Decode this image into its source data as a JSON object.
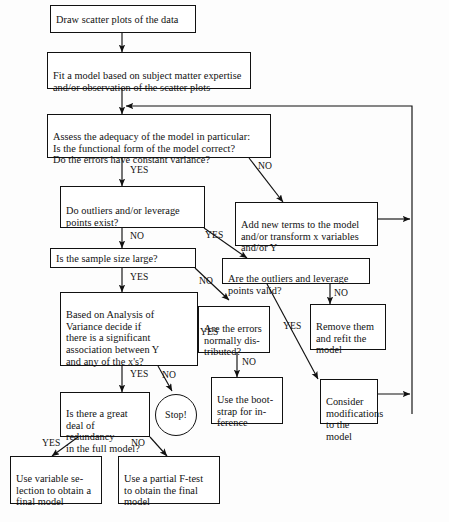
{
  "diagram": {
    "line_color": "#111111",
    "background": "#fdfdfd"
  },
  "nodes": {
    "draw_scatter": {
      "label": "Draw scatter plots of the data",
      "shape": "rect"
    },
    "fit_model": {
      "label": "Fit a model based on subject matter expertise\nand/or observation of the scatter plots",
      "shape": "rect"
    },
    "assess": {
      "label": "Assess the adequacy of the model in particular:\n     Is the functional form of the model correct?\n     Do the errors have constant variance?",
      "shape": "rect"
    },
    "outliers_exist": {
      "label": "Do outliers and/or leverage\npoints exist?",
      "shape": "rect"
    },
    "sample_size": {
      "label": "Is the sample size large?",
      "shape": "rect"
    },
    "anova": {
      "label": "Based on Analysis of\nVariance decide if\nthere is a significant\nassociation between Y\nand any of the x's?",
      "shape": "rect"
    },
    "redundancy": {
      "label": "Is there a great\ndeal of redundancy\nin the full model?",
      "shape": "rect"
    },
    "stop": {
      "label": "Stop!",
      "shape": "circle"
    },
    "variable_selection": {
      "label": "Use variable se-\nlection to obtain a\nfinal model",
      "shape": "rect"
    },
    "partial_f": {
      "label": "Use a partial F-test\nto obtain the final\nmodel",
      "shape": "rect"
    },
    "add_terms": {
      "label": "Add new terms to the model\nand/or transform x variables\nand/or Y",
      "shape": "rect"
    },
    "outliers_valid": {
      "label": "Are the outliers and leverage\npoints valid?",
      "shape": "rect"
    },
    "remove_refit": {
      "label": "Remove them\nand refit the\nmodel",
      "shape": "rect"
    },
    "errors_normal": {
      "label": "Are the errors\nnormally dis-\ntributed?",
      "shape": "rect"
    },
    "bootstrap": {
      "label": "Use the boot-\nstrap for in-\nference",
      "shape": "rect"
    },
    "consider_mods": {
      "label": "Consider\nmodifications\nto the model",
      "shape": "rect"
    }
  },
  "edge_labels": {
    "assess_no": "NO",
    "assess_yes": "YES",
    "outliers_no": "NO",
    "outliers_yes": "YES",
    "sample_yes": "YES",
    "sample_no": "NO",
    "valid_no": "NO",
    "valid_yes": "YES",
    "normal_yes": "YES",
    "normal_no": "NO",
    "anova_yes": "YES",
    "anova_no": "NO",
    "redundancy_yes": "YES",
    "redundancy_no": "NO"
  }
}
